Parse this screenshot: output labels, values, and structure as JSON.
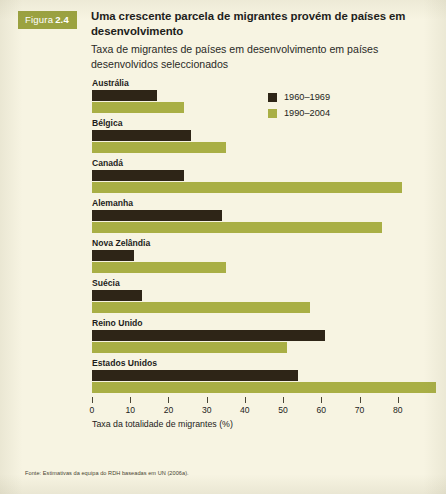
{
  "figure": {
    "badge_word": "Figura",
    "badge_number": "2.4",
    "badge_color": "#9ba240",
    "title": "Uma crescente parcela de migrantes provém de países em desenvolvimento",
    "subtitle": "Taxa de migrantes de países em desenvolvimento em países desenvolvidos seleccionados",
    "source": "Fonte: Estimativas da equipa do RDH baseadas em UN (2006a).",
    "background_color": "#f7f4e2"
  },
  "legend": {
    "items": [
      {
        "label": "1960–1969",
        "color": "#2e2517"
      },
      {
        "label": "1990–2004",
        "color": "#a9af45"
      }
    ]
  },
  "chart_data": {
    "type": "bar",
    "orientation": "horizontal",
    "title": "Uma crescente parcela de migrantes provém de países em desenvolvimento",
    "subtitle": "Taxa de migrantes de países em desenvolvimento em países desenvolvidos seleccionados",
    "xlabel": "Taxa da totalidade de migrantes (%)",
    "ylabel": "",
    "xlim": [
      0,
      90
    ],
    "xticks": [
      0,
      10,
      20,
      30,
      40,
      50,
      60,
      70,
      80
    ],
    "grid": false,
    "legend_position": "top-right",
    "categories": [
      "Austrália",
      "Bélgica",
      "Canadá",
      "Alemanha",
      "Nova Zelândia",
      "Suécia",
      "Reino Unido",
      "Estados Unidos"
    ],
    "series": [
      {
        "name": "1960–1969",
        "color": "#2e2517",
        "values": [
          17,
          26,
          24,
          34,
          11,
          13,
          61,
          54
        ]
      },
      {
        "name": "1990–2004",
        "color": "#a9af45",
        "values": [
          24,
          35,
          81,
          76,
          35,
          57,
          51,
          90
        ]
      }
    ]
  }
}
